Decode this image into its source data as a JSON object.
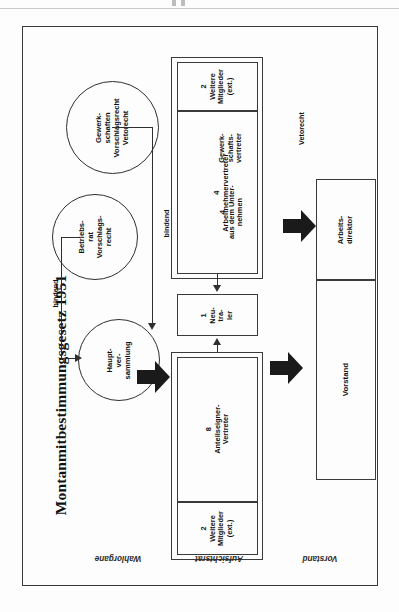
{
  "figure": {
    "title": "Montanmitbestimmungsgesetz 1951"
  },
  "wahlorgane": {
    "section_label": "Wahlorgane",
    "circles": [
      {
        "id": "gewerkschaften",
        "lines": "Gewerk-\nschaften\nVorschlagsrecht\nVetorecht"
      },
      {
        "id": "betriebsrat",
        "lines": "Betriebs-\nrat\nVorschlags-\nrecht"
      },
      {
        "id": "hauptversammlung",
        "lines": "Haupt-\nver-\nsammlung"
      }
    ],
    "edge_labels": {
      "gewerkschaften_to_hv": "bindend",
      "betriebsrat_to_hv": "bindend"
    }
  },
  "aufsichtsrat": {
    "section_label": "Aufsichtsrat",
    "boxes": [
      {
        "id": "weitere-oben",
        "count": "2",
        "lines": "2\nWeitere\nMitglieder\n(ext.)"
      },
      {
        "id": "arbeitnehmer",
        "count": "4",
        "lines": "4\nArbeitnehmervertreter"
      },
      {
        "id": "aus-unternehmen",
        "count": "4",
        "lines": "4\naus dem Unter-\nnehmen"
      },
      {
        "id": "gewerkschaftsvertreter",
        "count": "",
        "lines": "Gewerk-\nschafts-\nvertreter"
      },
      {
        "id": "neutraler",
        "count": "1",
        "lines": "1\nNeu-\ntra-\nler"
      },
      {
        "id": "anteilseigner",
        "count": "8",
        "lines": "8\nAnteilseigner-\nVertreter"
      },
      {
        "id": "weitere-unten",
        "count": "2",
        "lines": "2\nWeitere\nMitglieder\n(ext.)"
      }
    ]
  },
  "vorstand": {
    "section_label": "Vorstand",
    "boxes": [
      {
        "id": "arbeitsdirektor",
        "lines": "Arbeits-\ndirektor"
      },
      {
        "id": "vorstand",
        "lines": "Vorstand"
      }
    ],
    "edge_labels": {
      "veto": "Vetorecht"
    }
  }
}
